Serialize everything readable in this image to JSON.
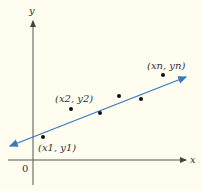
{
  "diagram": {
    "type": "scatter-with-regression-line",
    "axes": {
      "x_label": "x",
      "y_label": "y",
      "origin_label": "0"
    },
    "colors": {
      "background": "#fefdf0",
      "axis": "#555555",
      "line": "#3a78c0",
      "point": "#111111"
    },
    "points": [
      {
        "label": "(x1, y1)"
      },
      {
        "label": "(x2, y2)"
      },
      {
        "label": ""
      },
      {
        "label": ""
      },
      {
        "label": ""
      },
      {
        "label": "(xn, yn)"
      }
    ]
  }
}
